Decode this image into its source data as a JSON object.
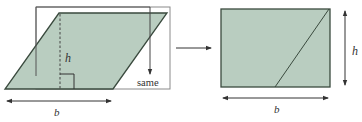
{
  "diagram": {
    "colors": {
      "fill": "#b9cdc0",
      "stroke": "#3a4a3e",
      "line": "#444444",
      "text": "#333333",
      "background": "#ffffff"
    },
    "left_figure": {
      "shape": "parallelogram",
      "height_label": "h",
      "base_label": "b",
      "cut_label": "same"
    },
    "transition_arrow": "right-arrow",
    "right_figure": {
      "shape": "rectangle",
      "height_label": "h",
      "base_label": "b"
    }
  }
}
